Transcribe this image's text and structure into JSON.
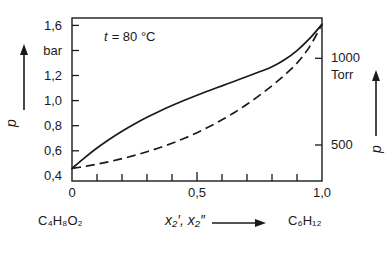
{
  "chart_data": {
    "type": "line",
    "title": "",
    "annotation": "t = 80 °C",
    "xlabel": "x₂′, x₂″",
    "ylabel": "p",
    "ylabel_right": "p",
    "yunit": "bar",
    "yunit_right": "Torr",
    "xlim": [
      0,
      1
    ],
    "ylim": [
      0.4,
      1.7
    ],
    "ylim_right": [
      300,
      1275
    ],
    "grid": false,
    "legend": false,
    "x_endpoint_left": "C₄H₈O₂",
    "x_endpoint_right": "C₆H₁₂",
    "xticks": [
      0,
      0.5,
      1.0
    ],
    "xtick_labels": [
      "0",
      "0,5",
      "1,0"
    ],
    "xminor_ticks": [
      0.1,
      0.2,
      0.3,
      0.4,
      0.6,
      0.7,
      0.8,
      0.9
    ],
    "yticks": [
      0.4,
      0.6,
      0.8,
      1.0,
      1.2,
      1.4,
      1.6
    ],
    "ytick_labels": [
      "0,4",
      "0,6",
      "0,8",
      "1,0",
      "1,2",
      "bar",
      "1,6"
    ],
    "yticks_right": [
      500,
      1000
    ],
    "ytick_labels_right": [
      "500",
      "1000"
    ],
    "series": [
      {
        "name": "bubble-point-curve",
        "style": "solid",
        "x": [
          0.0,
          0.05,
          0.1,
          0.15,
          0.2,
          0.25,
          0.3,
          0.35,
          0.4,
          0.45,
          0.5,
          0.55,
          0.6,
          0.65,
          0.7,
          0.75,
          0.8,
          0.85,
          0.9,
          0.95,
          1.0
        ],
        "y": [
          0.5,
          0.585,
          0.663,
          0.733,
          0.797,
          0.855,
          0.908,
          0.957,
          1.002,
          1.044,
          1.084,
          1.122,
          1.159,
          1.196,
          1.233,
          1.271,
          1.311,
          1.367,
          1.44,
          1.535,
          1.65
        ]
      },
      {
        "name": "dew-point-curve",
        "style": "dashed",
        "x": [
          0.0,
          0.05,
          0.1,
          0.15,
          0.2,
          0.25,
          0.3,
          0.35,
          0.4,
          0.45,
          0.5,
          0.55,
          0.6,
          0.65,
          0.7,
          0.75,
          0.8,
          0.85,
          0.9,
          0.95,
          1.0
        ],
        "y": [
          0.5,
          0.516,
          0.534,
          0.555,
          0.578,
          0.604,
          0.633,
          0.665,
          0.701,
          0.741,
          0.785,
          0.834,
          0.888,
          0.947,
          1.012,
          1.083,
          1.16,
          1.244,
          1.34,
          1.47,
          1.65
        ]
      }
    ]
  },
  "axes": {
    "left_unit": "bar",
    "left_symbol": "p",
    "right_unit": "Torr",
    "right_symbol": "p",
    "x_symbol_primary": "x",
    "x_sub": "2",
    "x_prime_single": "′",
    "x_prime_double": "″",
    "arrow": "⟶"
  },
  "labels": {
    "y_1_6": "1,6",
    "y_bar": "bar",
    "y_1_2": "1,2",
    "y_1_0": "1,0",
    "y_0_8": "0,8",
    "y_0_6": "0,6",
    "y_0_4": "0,4",
    "r_1000": "1000",
    "r_torr": "Torr",
    "r_500": "500",
    "x_0": "0",
    "x_05": "0,5",
    "x_10": "1,0",
    "comp_left": "C₄H₈O₂",
    "comp_right": "C₆H₁₂",
    "annotation": "t = 80 °C",
    "annot_t": "t",
    "annot_eq": "= 80 °C",
    "xaxis_label": "x₂′, x₂″",
    "p_left": "p",
    "p_right": "p"
  },
  "colors": {
    "line": "#1a1a1a",
    "background": "#ffffff",
    "text": "#1a1a1a"
  }
}
